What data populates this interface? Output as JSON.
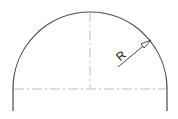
{
  "drawing": {
    "title": "Semicircle with radius dimension",
    "dimension_label": "R",
    "colors": {
      "outline": "#4a4a4a",
      "centerline": "#bdbdbd",
      "dimension": "#333333",
      "background": "#ffffff"
    }
  }
}
